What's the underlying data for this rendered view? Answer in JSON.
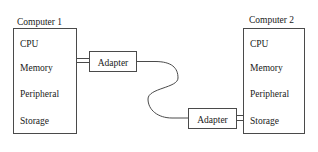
{
  "diagram": {
    "type": "block-diagram",
    "background_color": "#ffffff",
    "line_color": "#4a4a4a",
    "text_color": "#1a1a1a",
    "computers": [
      {
        "title": "Computer 1",
        "components": [
          "CPU",
          "Memory",
          "Peripheral",
          "Storage"
        ]
      },
      {
        "title": "Computer 2",
        "components": [
          "CPU",
          "Memory",
          "Peripheral",
          "Storage"
        ]
      }
    ],
    "adapters": [
      {
        "label": "Adapter"
      },
      {
        "label": "Adapter"
      }
    ],
    "connections": [
      {
        "from": "Computer 1",
        "to": "Adapter 1",
        "style": "double-line"
      },
      {
        "from": "Adapter 1",
        "to": "Adapter 2",
        "style": "curved-cable"
      },
      {
        "from": "Adapter 2",
        "to": "Computer 2",
        "style": "double-line"
      }
    ]
  }
}
